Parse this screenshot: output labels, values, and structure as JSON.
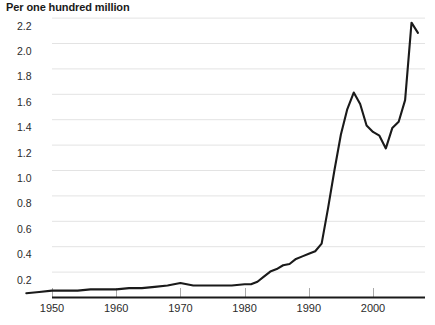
{
  "chart_data": {
    "type": "line",
    "title": "Per one hundred million",
    "xlabel": "",
    "ylabel": "",
    "xlim": [
      1946,
      1954
    ],
    "ylim": [
      0,
      2.2
    ],
    "grid": true,
    "legend": null,
    "line_color": "#1a1a1a",
    "grid_color": "#e3e3e3",
    "axis_color": "#1a1a1a",
    "ytick_labels": [
      "0.2",
      "0.4",
      "0.6",
      "0.8",
      "1.0",
      "1.2",
      "1.4",
      "1.6",
      "1.8",
      "2.0",
      "2.2"
    ],
    "ytick_values": [
      0.2,
      0.4,
      0.6,
      0.8,
      1.0,
      1.2,
      1.4,
      1.6,
      1.8,
      2.0,
      2.2
    ],
    "xtick_labels": [
      "1950",
      "1960",
      "1970",
      "1980",
      "1990",
      "2000"
    ],
    "xtick_values": [
      1950,
      1960,
      1970,
      1980,
      1990,
      2000
    ],
    "x": [
      1946,
      1948,
      1950,
      1952,
      1954,
      1956,
      1958,
      1960,
      1962,
      1964,
      1966,
      1968,
      1969,
      1970,
      1971,
      1972,
      1973,
      1974,
      1976,
      1978,
      1980,
      1981,
      1982,
      1983,
      1984,
      1985,
      1986,
      1987,
      1988,
      1989,
      1990,
      1991,
      1992,
      1993,
      1994,
      1995,
      1996,
      1997,
      1998,
      1999,
      2000,
      2001,
      2002,
      2003,
      2004,
      2005,
      2006,
      2007
    ],
    "values": [
      0.03,
      0.04,
      0.05,
      0.05,
      0.05,
      0.06,
      0.06,
      0.06,
      0.07,
      0.07,
      0.08,
      0.09,
      0.1,
      0.11,
      0.1,
      0.09,
      0.09,
      0.09,
      0.09,
      0.09,
      0.1,
      0.1,
      0.12,
      0.16,
      0.2,
      0.22,
      0.25,
      0.26,
      0.3,
      0.32,
      0.34,
      0.36,
      0.42,
      0.7,
      1.0,
      1.28,
      1.48,
      1.61,
      1.52,
      1.35,
      1.3,
      1.27,
      1.17,
      1.33,
      1.38,
      1.55,
      2.16,
      2.08
    ],
    "series_name": "rate"
  }
}
